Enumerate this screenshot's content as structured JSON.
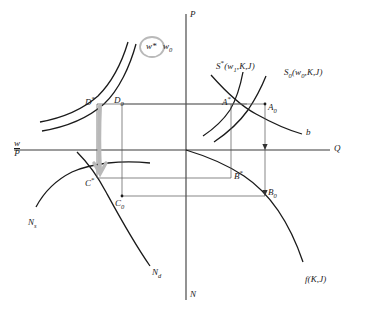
{
  "figure": {
    "type": "economics-four-quadrant-diagram",
    "axes": {
      "vertical_top": "P",
      "vertical_bottom": "N",
      "horizontal_right": "Q",
      "horizontal_left_num": "w",
      "horizontal_left_den": "P"
    },
    "wage_labels": {
      "w_star": "w*",
      "w_zero": "w",
      "w_zero_sub": "0"
    },
    "curves": {
      "supply_star": {
        "base": "S",
        "star": "*",
        "args": "(w",
        "arg_sub": "1",
        "args_rest": ",K,J)"
      },
      "supply_zero": {
        "base": "S",
        "sub": "0",
        "args": "(w",
        "arg_sub": "0",
        "args_rest": ",K,J)"
      },
      "demand_b": "b",
      "labor_supply": {
        "base": "N",
        "sub": "s"
      },
      "labor_demand": {
        "base": "N",
        "sub": "d"
      },
      "production": "f(K,J)"
    },
    "points": [
      {
        "name": "D-star",
        "base": "D",
        "mark": "*",
        "quadrant": "upper-left"
      },
      {
        "name": "D-zero",
        "base": "D",
        "mark": "0",
        "quadrant": "upper-left"
      },
      {
        "name": "A-star",
        "base": "A",
        "mark": "*",
        "quadrant": "upper-right"
      },
      {
        "name": "A-zero",
        "base": "A",
        "mark": "0",
        "quadrant": "upper-right"
      },
      {
        "name": "B-star",
        "base": "B",
        "mark": "*",
        "quadrant": "lower-right"
      },
      {
        "name": "B-zero",
        "base": "B",
        "mark": "0",
        "quadrant": "lower-right"
      },
      {
        "name": "C-star",
        "base": "C",
        "mark": "*",
        "quadrant": "lower-left"
      },
      {
        "name": "C-zero",
        "base": "C",
        "mark": "0",
        "quadrant": "lower-left"
      }
    ],
    "colors": {
      "ink": "#1a1a1a",
      "axis": "#3a3a3a",
      "thin_line": "#555555",
      "highlight": "#b9b9b9"
    }
  }
}
